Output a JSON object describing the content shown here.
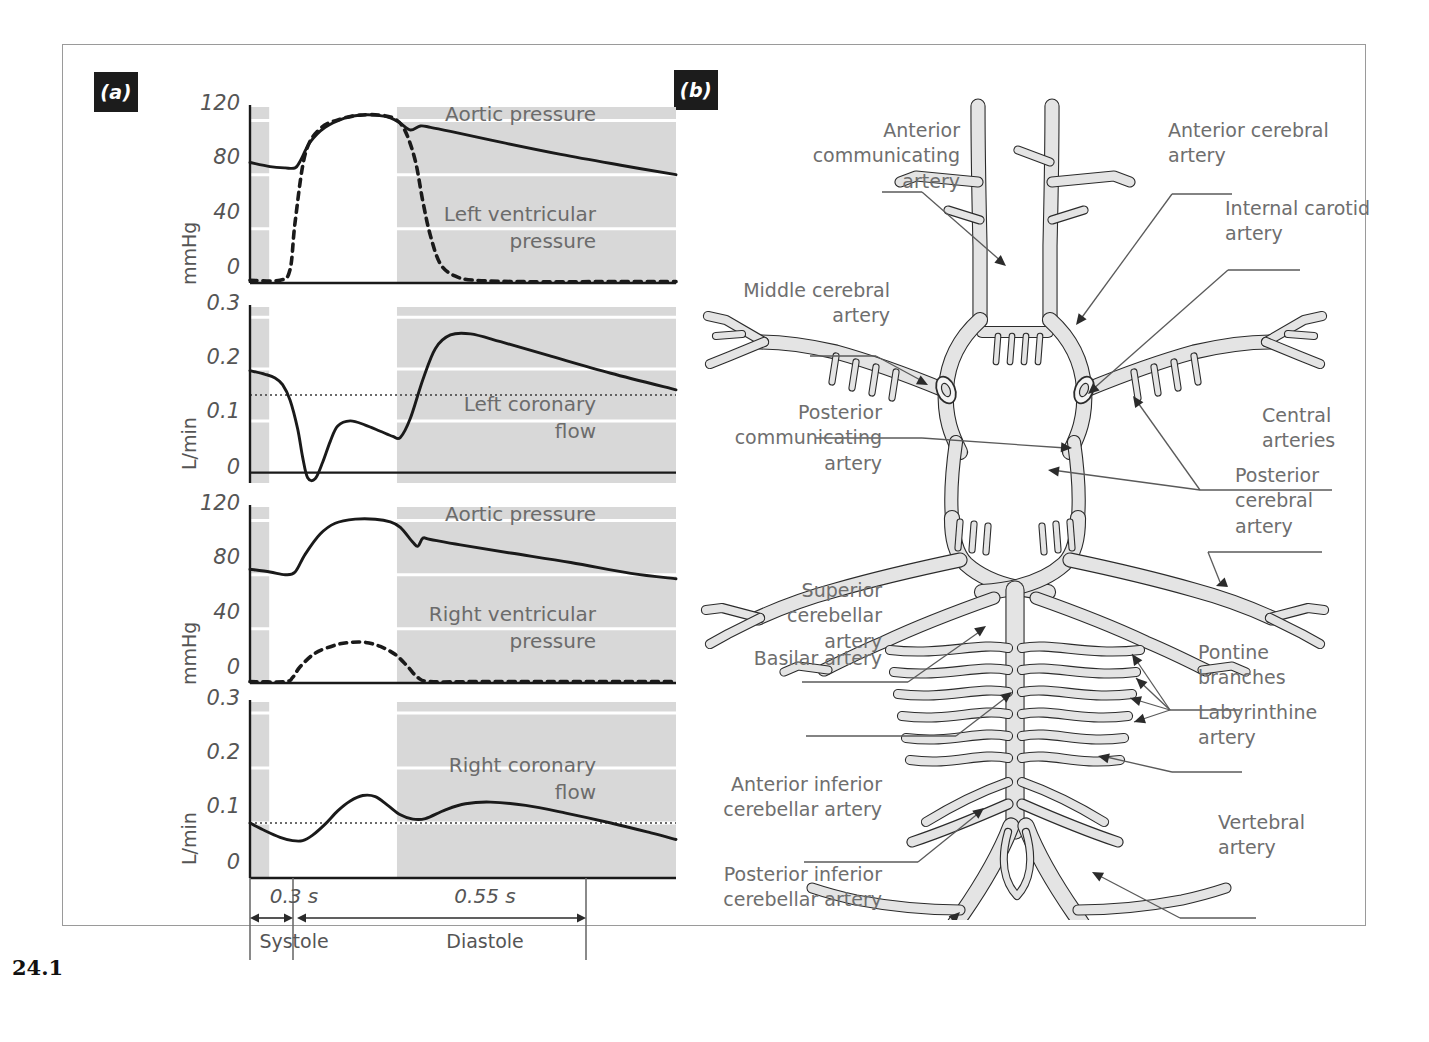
{
  "figure": {
    "number": "24.1",
    "panel_a_tag": "(a)",
    "panel_b_tag": "(b)"
  },
  "chart_data": [
    {
      "id": "panel1",
      "type": "line",
      "title": "",
      "ylabel": "mmHg",
      "yticks": [
        "120",
        "80",
        "40",
        "0"
      ],
      "ylim": [
        0,
        130
      ],
      "xlim": [
        0,
        0.85
      ],
      "xlabel": "",
      "grid": true,
      "legend_position": "inside-right",
      "annotations": [
        "Aortic pressure",
        "Left ventricular\npressure"
      ],
      "series": [
        {
          "name": "Aortic pressure",
          "style": "solid",
          "x": [
            0.0,
            0.04,
            0.07,
            0.09,
            0.1,
            0.12,
            0.15,
            0.19,
            0.22,
            0.25,
            0.28,
            0.3,
            0.32,
            0.34,
            0.36,
            0.4,
            0.5,
            0.62,
            0.74,
            0.85
          ],
          "y": [
            89,
            86,
            85,
            85,
            90,
            104,
            115,
            122,
            124,
            124,
            122,
            118,
            113,
            116,
            115,
            112,
            104,
            95,
            87,
            80
          ]
        },
        {
          "name": "Left ventricular pressure",
          "style": "dashed",
          "x": [
            0.0,
            0.06,
            0.08,
            0.09,
            0.11,
            0.14,
            0.18,
            0.22,
            0.26,
            0.29,
            0.31,
            0.33,
            0.345,
            0.36,
            0.38,
            0.41,
            0.45,
            0.55,
            0.7,
            0.85
          ],
          "y": [
            2,
            2,
            10,
            45,
            95,
            114,
            121,
            124,
            124,
            121,
            112,
            90,
            60,
            35,
            14,
            5,
            2,
            1,
            1,
            1
          ]
        }
      ]
    },
    {
      "id": "panel2",
      "type": "line",
      "title": "",
      "ylabel": "L/min",
      "yticks": [
        "0.3",
        "0.2",
        "0.1",
        "0"
      ],
      "ylim": [
        -0.02,
        0.32
      ],
      "xlim": [
        0,
        0.85
      ],
      "xlabel": "",
      "grid": true,
      "mean_line": 0.15,
      "annotations": [
        "Left coronary\nflow"
      ],
      "series": [
        {
          "name": "Left coronary flow",
          "style": "solid",
          "x": [
            0.0,
            0.03,
            0.05,
            0.065,
            0.08,
            0.095,
            0.105,
            0.115,
            0.13,
            0.145,
            0.16,
            0.175,
            0.2,
            0.23,
            0.26,
            0.285,
            0.3,
            0.32,
            0.345,
            0.37,
            0.4,
            0.44,
            0.5,
            0.6,
            0.72,
            0.85
          ],
          "y": [
            0.197,
            0.19,
            0.183,
            0.17,
            0.14,
            0.085,
            0.03,
            -0.01,
            -0.012,
            0.02,
            0.06,
            0.09,
            0.1,
            0.092,
            0.08,
            0.07,
            0.068,
            0.105,
            0.18,
            0.24,
            0.266,
            0.268,
            0.253,
            0.225,
            0.192,
            0.16
          ]
        }
      ]
    },
    {
      "id": "panel3",
      "type": "line",
      "title": "",
      "ylabel": "mmHg",
      "yticks": [
        "120",
        "80",
        "40",
        "0"
      ],
      "ylim": [
        0,
        130
      ],
      "xlim": [
        0,
        0.85
      ],
      "xlabel": "",
      "grid": true,
      "annotations": [
        "Aortic pressure",
        "Right ventricular\npressure"
      ],
      "series": [
        {
          "name": "Aortic pressure",
          "style": "solid",
          "x": [
            0.0,
            0.04,
            0.07,
            0.09,
            0.11,
            0.14,
            0.17,
            0.21,
            0.25,
            0.28,
            0.3,
            0.325,
            0.335,
            0.345,
            0.36,
            0.42,
            0.52,
            0.64,
            0.76,
            0.85
          ],
          "y": [
            84,
            82,
            80,
            82,
            95,
            110,
            118,
            121,
            121,
            119,
            115,
            104,
            101,
            107,
            106,
            102,
            96,
            89,
            81,
            77
          ]
        },
        {
          "name": "Right ventricular pressure",
          "style": "dashed",
          "x": [
            0.0,
            0.07,
            0.085,
            0.1,
            0.13,
            0.17,
            0.2,
            0.23,
            0.26,
            0.29,
            0.315,
            0.335,
            0.36,
            0.45,
            0.6,
            0.75,
            0.85
          ],
          "y": [
            1,
            1,
            4,
            12,
            22,
            28,
            30,
            30,
            27,
            21,
            12,
            4,
            1,
            1,
            1,
            1,
            1
          ]
        }
      ]
    },
    {
      "id": "panel4",
      "type": "line",
      "title": "",
      "ylabel": "L/min",
      "yticks": [
        "0.3",
        "0.2",
        "0.1",
        "0"
      ],
      "ylim": [
        0,
        0.32
      ],
      "xlim": [
        0,
        0.85
      ],
      "xlabel": "",
      "grid": true,
      "mean_line": 0.1,
      "annotations": [
        "Right coronary\nflow"
      ],
      "series": [
        {
          "name": "Right coronary flow",
          "style": "solid",
          "x": [
            0.0,
            0.03,
            0.06,
            0.085,
            0.105,
            0.125,
            0.15,
            0.175,
            0.2,
            0.225,
            0.25,
            0.275,
            0.3,
            0.325,
            0.35,
            0.39,
            0.43,
            0.48,
            0.55,
            0.63,
            0.72,
            0.8,
            0.85
          ],
          "y": [
            0.1,
            0.086,
            0.074,
            0.068,
            0.068,
            0.078,
            0.098,
            0.122,
            0.14,
            0.15,
            0.148,
            0.132,
            0.115,
            0.107,
            0.108,
            0.124,
            0.135,
            0.138,
            0.132,
            0.118,
            0.1,
            0.082,
            0.07
          ]
        }
      ]
    }
  ],
  "time_axis": {
    "systole_duration": "0.3 s",
    "diastole_duration": "0.55 s",
    "systole_label": "Systole",
    "diastole_label": "Diastole"
  },
  "artery_diagram": {
    "title": "Circle of Willis and posterior cerebral circulation",
    "labels": [
      {
        "id": "anterior-communicating-artery",
        "text": "Anterior\ncommunicating\nartery",
        "align": "right"
      },
      {
        "id": "anterior-cerebral-artery",
        "text": "Anterior cerebral\nartery",
        "align": "left"
      },
      {
        "id": "internal-carotid-artery",
        "text": "Internal carotid\nartery",
        "align": "left"
      },
      {
        "id": "middle-cerebral-artery",
        "text": "Middle cerebral\nartery",
        "align": "right"
      },
      {
        "id": "central-arteries",
        "text": "Central\narteries",
        "align": "left"
      },
      {
        "id": "posterior-communicating-artery",
        "text": "Posterior\ncommunicating\nartery",
        "align": "right"
      },
      {
        "id": "posterior-cerebral-artery",
        "text": "Posterior\ncerebral\nartery",
        "align": "left"
      },
      {
        "id": "superior-cerebellar-artery",
        "text": "Superior\ncerebellar\nartery",
        "align": "right"
      },
      {
        "id": "basilar-artery",
        "text": "Basilar artery",
        "align": "right"
      },
      {
        "id": "pontine-branches",
        "text": "Pontine\nbranches",
        "align": "left"
      },
      {
        "id": "labyrinthine-artery",
        "text": "Labyrinthine\nartery",
        "align": "left"
      },
      {
        "id": "anterior-inferior-cerebellar-artery",
        "text": "Anterior inferior\ncerebellar artery",
        "align": "right"
      },
      {
        "id": "vertebral-artery",
        "text": "Vertebral\nartery",
        "align": "left"
      },
      {
        "id": "posterior-inferior-cerebellar-artery",
        "text": "Posterior inferior\ncerebellar artery",
        "align": "right"
      }
    ]
  },
  "colors": {
    "shade_gray": "#d8d8d8",
    "curve_black": "#1a1a1a",
    "text_gray": "#6b6b6b",
    "vessel_fill": "#e4e4e4",
    "vessel_stroke": "#2b2b2b",
    "frame": "#9a9a9a"
  }
}
